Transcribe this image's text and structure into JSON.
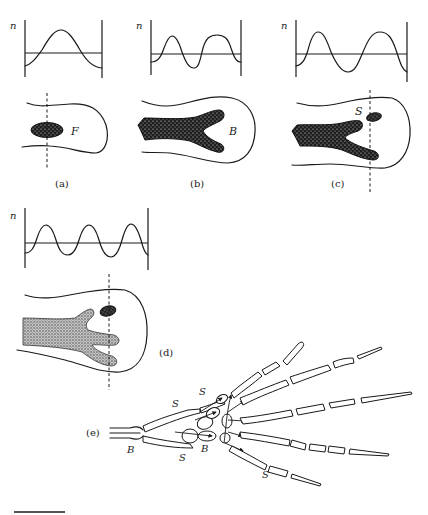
{
  "figure": {
    "panels": [
      {
        "id": "a",
        "label": "(a)",
        "axis_label": "n",
        "tissue_label": "F",
        "waveform": "half-wavelength mode (1 peak)"
      },
      {
        "id": "b",
        "label": "(b)",
        "axis_label": "n",
        "tissue_label": "B",
        "waveform": "2 peaks, 1 trough"
      },
      {
        "id": "c",
        "label": "(c)",
        "axis_label": "n",
        "tissue_label": "S",
        "waveform": "2 peaks, 2 troughs"
      },
      {
        "id": "d",
        "label": "(d)",
        "axis_label": "n",
        "tissue_label": "",
        "waveform": "3 peaks, 2 troughs"
      },
      {
        "id": "e",
        "label": "(e)",
        "annotations": [
          "S",
          "S",
          "S",
          "S",
          "B",
          "B"
        ]
      }
    ],
    "panel_e_labels": {
      "s1": "S",
      "s2": "S",
      "s3": "S",
      "s4": "S",
      "b1": "B",
      "b2": "B"
    },
    "scale_bar": "scale-bar",
    "colors": {
      "ink": "#1a1a1a",
      "fill_dark": "#2a2a2a",
      "fill_light": "#8a8a8a",
      "background": "#ffffff"
    }
  }
}
